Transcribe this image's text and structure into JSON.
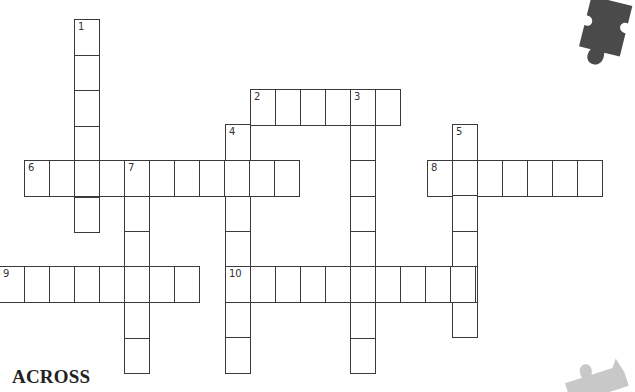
{
  "puzzle": {
    "cell_width": 25,
    "cell_height": 35.5,
    "border_color": "#3a3a3a",
    "clues_heading": "ACROSS",
    "entries": [
      {
        "number": "1",
        "direction": "down",
        "x": 74,
        "y": 19,
        "length": 6
      },
      {
        "number": "2",
        "direction": "across",
        "x": 250,
        "y": 89,
        "length": 6
      },
      {
        "number": "3",
        "direction": "down",
        "x": 350,
        "y": 89,
        "length": 8
      },
      {
        "number": "4",
        "direction": "down",
        "x": 225,
        "y": 124,
        "length": 7
      },
      {
        "number": "5",
        "direction": "down",
        "x": 452,
        "y": 124,
        "length": 6
      },
      {
        "number": "6",
        "direction": "across",
        "x": 24,
        "y": 160,
        "length": 11
      },
      {
        "number": "7",
        "direction": "down",
        "x": 124,
        "y": 160,
        "length": 6
      },
      {
        "number": "8",
        "direction": "across",
        "x": 427,
        "y": 160,
        "length": 7
      },
      {
        "number": "9",
        "direction": "across",
        "x": -1,
        "y": 266,
        "length": 8
      },
      {
        "number": "10",
        "direction": "across",
        "x": 225,
        "y": 266,
        "length": 10
      }
    ]
  },
  "decorations": {
    "puzzle_piece_dark_color": "#4a4a4a",
    "puzzle_piece_light_color": "#c8c8c8"
  }
}
